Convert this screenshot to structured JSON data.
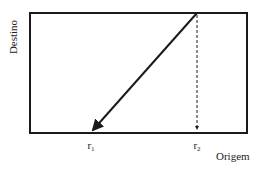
{
  "diagram": {
    "type": "mapping-diagram",
    "axes": {
      "y_label": "Destino",
      "x_label": "Origem"
    },
    "x_markers": [
      {
        "name": "r",
        "subscript": "1",
        "x": 91
      },
      {
        "name": "r",
        "subscript": "2",
        "x": 197
      }
    ],
    "frame": {
      "left": 30,
      "top": 13,
      "right": 247,
      "bottom": 133
    },
    "lines": [
      {
        "kind": "solid-arrow",
        "from": [
          197,
          13
        ],
        "to": [
          91,
          133
        ],
        "description": "diagonal from top at r2 down to r1 with arrowhead"
      },
      {
        "kind": "dashed",
        "from": [
          197,
          13
        ],
        "to": [
          197,
          133
        ],
        "description": "vertical dashed line at r2"
      }
    ],
    "colors": {
      "stroke": "#1a1a1a",
      "background": "#ffffff"
    }
  }
}
